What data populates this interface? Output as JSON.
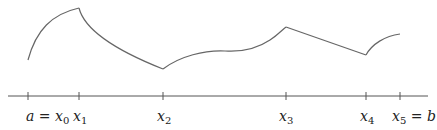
{
  "diagram": {
    "title": "",
    "partition_labels": [
      {
        "prefix": "a = ",
        "var": "x",
        "sub": "0",
        "suffix": ""
      },
      {
        "prefix": "",
        "var": "x",
        "sub": "1",
        "suffix": ""
      },
      {
        "prefix": "",
        "var": "x",
        "sub": "2",
        "suffix": ""
      },
      {
        "prefix": "",
        "var": "x",
        "sub": "3",
        "suffix": ""
      },
      {
        "prefix": "",
        "var": "x",
        "sub": "4",
        "suffix": ""
      },
      {
        "prefix": "",
        "var": "x",
        "sub": "5",
        "suffix": " = b"
      }
    ],
    "colors": {
      "curve": "#666666",
      "axis": "#555555",
      "text": "#222222"
    }
  }
}
